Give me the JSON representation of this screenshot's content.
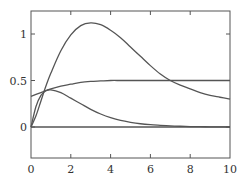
{
  "chart_data": {
    "type": "line",
    "title": "",
    "xlabel": "",
    "ylabel": "",
    "xlim": [
      0,
      10
    ],
    "ylim": [
      -0.33,
      1.25
    ],
    "grid": false,
    "legend": null,
    "x_ticks": [
      0,
      2,
      4,
      6,
      8,
      10
    ],
    "x_tick_labels": [
      "0",
      "2",
      "4",
      "6",
      "8",
      "10"
    ],
    "y_ticks": [
      0,
      0.5,
      1
    ],
    "y_tick_labels": [
      "0",
      "0.5",
      "1"
    ],
    "x": [
      0,
      0.25,
      0.5,
      0.75,
      1,
      1.5,
      2,
      2.5,
      3,
      3.5,
      4,
      4.5,
      5,
      5.5,
      6,
      6.5,
      7,
      7.5,
      8,
      8.5,
      9,
      9.5,
      10
    ],
    "series": [
      {
        "name": "curve-large-peak",
        "values": [
          0,
          0.12,
          0.28,
          0.44,
          0.58,
          0.82,
          0.99,
          1.09,
          1.12,
          1.1,
          1.04,
          0.96,
          0.86,
          0.76,
          0.66,
          0.57,
          0.5,
          0.45,
          0.41,
          0.37,
          0.34,
          0.32,
          0.3
        ]
      },
      {
        "name": "curve-saturating",
        "values": [
          0.33,
          0.35,
          0.37,
          0.39,
          0.41,
          0.44,
          0.46,
          0.48,
          0.49,
          0.495,
          0.5,
          0.5,
          0.5,
          0.5,
          0.5,
          0.5,
          0.5,
          0.5,
          0.5,
          0.5,
          0.5,
          0.5,
          0.5
        ]
      },
      {
        "name": "curve-small-peak",
        "values": [
          0,
          0.22,
          0.34,
          0.39,
          0.4,
          0.37,
          0.31,
          0.25,
          0.19,
          0.14,
          0.1,
          0.07,
          0.05,
          0.035,
          0.025,
          0.018,
          0.012,
          0.008,
          0.005,
          0.003,
          0.002,
          0.001,
          0
        ]
      },
      {
        "name": "curve-zero",
        "values": [
          0,
          0,
          0,
          0,
          0,
          0,
          0,
          0,
          0,
          0,
          0,
          0,
          0,
          0,
          0,
          0,
          0,
          0,
          0,
          0,
          0,
          0,
          0
        ]
      }
    ]
  },
  "plot_area": {
    "left": 31,
    "top": 11,
    "right": 230,
    "bottom": 158,
    "y_zero_px": 127,
    "y_one_px": 34
  },
  "colors": {
    "frame": "#555555",
    "curve": "#555555",
    "text": "#333333",
    "background": "#ffffff"
  }
}
